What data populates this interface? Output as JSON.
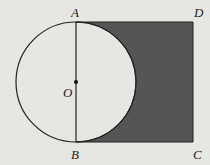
{
  "figure": {
    "labels": {
      "A": "A",
      "B": "B",
      "C": "C",
      "D": "D",
      "O": "O"
    },
    "colors": {
      "background": "#e6e6e3",
      "shade": "#555555",
      "stroke": "#222222"
    }
  }
}
